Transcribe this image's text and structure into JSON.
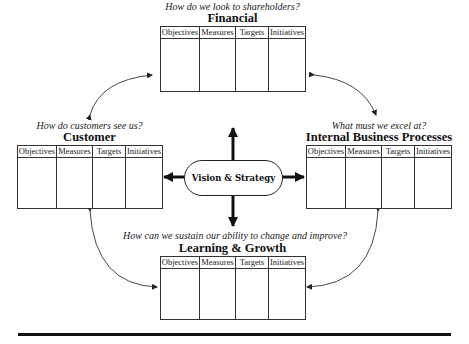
{
  "diagram": {
    "center": {
      "label": "Vision & Strategy"
    },
    "column_headers": [
      "Objectives",
      "Measures",
      "Targets",
      "Initiatives"
    ],
    "perspectives": {
      "financial": {
        "title": "Financial",
        "question": "How do we look to shareholders?",
        "columns": [
          "Objectives",
          "Measures",
          "Targets",
          "Initiatives"
        ]
      },
      "customer": {
        "title": "Customer",
        "question": "How do customers see us?",
        "columns": [
          "Objectives",
          "Measures",
          "Targets",
          "Initiatives"
        ]
      },
      "internal": {
        "title": "Internal Business Processes",
        "question": "What must we excel at?",
        "columns": [
          "Objectives",
          "Measures",
          "Targets",
          "Initiatives"
        ]
      },
      "learning": {
        "title": "Learning & Growth",
        "question": "How can we sustain our ability to change and improve?",
        "columns": [
          "Objectives",
          "Measures",
          "Targets",
          "Initiatives"
        ]
      }
    },
    "colors": {
      "line": "#222222",
      "background": "#ffffff",
      "text": "#111111"
    }
  }
}
